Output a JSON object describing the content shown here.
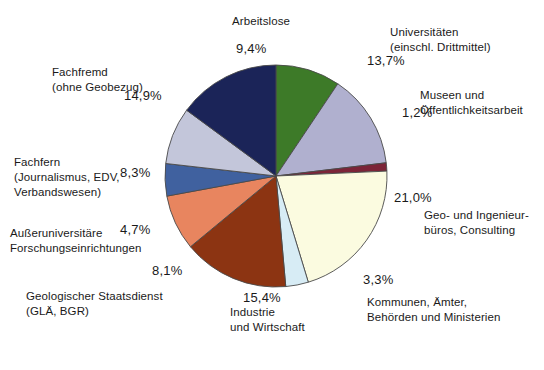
{
  "chart_data": {
    "type": "pie",
    "title": "",
    "subtitle": "",
    "xlabel": "",
    "ylabel": "",
    "legend_position": "none",
    "grid": false,
    "value_suffix": "%",
    "decimal_separator": ",",
    "start_angle_deg": -90,
    "direction": "clockwise",
    "categories": [
      "Arbeitslose",
      "Universitäten (einschl. Drittmittel)",
      "Museen und Öffentlichkeitsarbeit",
      "Geo- und Ingenieurbüros, Consulting",
      "Kommunen, Ämter, Behörden und Ministerien",
      "Industrie und Wirtschaft",
      "Geologischer Staatsdienst (GLÄ, BGR)",
      "Außeruniversitäre Forschungseinrichtungen",
      "Fachfern (Journalismus, EDV, Verbandswesen)",
      "Fachfremd (ohne Geobezug)"
    ],
    "values": [
      9.4,
      13.7,
      1.2,
      21.0,
      3.3,
      15.4,
      8.1,
      4.7,
      8.3,
      14.9
    ],
    "colors": [
      "#3d7a28",
      "#b0b0cf",
      "#7c2438",
      "#fbfbe0",
      "#d7ecf5",
      "#8c3412",
      "#e8855f",
      "#40619f",
      "#c3c6da",
      "#1b2458"
    ],
    "slice_border_color": "#4a4a4a",
    "slices": [
      {
        "label_lines": [
          "Arbeitslose"
        ],
        "percent": "9,4%",
        "value": 9.4,
        "color": "#3d7a28"
      },
      {
        "label_lines": [
          "Universitäten",
          "(einschl. Drittmittel)"
        ],
        "percent": "13,7%",
        "value": 13.7,
        "color": "#b0b0cf"
      },
      {
        "label_lines": [
          "Museen und",
          "Öffentlichkeitsarbeit"
        ],
        "percent": "1,2%",
        "value": 1.2,
        "color": "#7c2438"
      },
      {
        "label_lines": [
          "Geo- und Ingenieur-",
          "büros, Consulting"
        ],
        "percent": "21,0%",
        "value": 21.0,
        "color": "#fbfbe0"
      },
      {
        "label_lines": [
          "Kommunen, Ämter,",
          "Behörden und Ministerien"
        ],
        "percent": "3,3%",
        "value": 3.3,
        "color": "#d7ecf5"
      },
      {
        "label_lines": [
          "Industrie",
          "und Wirtschaft"
        ],
        "percent": "15,4%",
        "value": 15.4,
        "color": "#8c3412"
      },
      {
        "label_lines": [
          "Geologischer Staatsdienst",
          "(GLÄ, BGR)"
        ],
        "percent": "8,1%",
        "value": 8.1,
        "color": "#e8855f"
      },
      {
        "label_lines": [
          "Außeruniversitäre",
          "Forschungseinrichtungen"
        ],
        "percent": "4,7%",
        "value": 4.7,
        "color": "#40619f"
      },
      {
        "label_lines": [
          "Fachfern",
          "(Journalismus, EDV,",
          "Verbandswesen)"
        ],
        "percent": "8,3%",
        "value": 8.3,
        "color": "#c3c6da"
      },
      {
        "label_lines": [
          "Fachfremd",
          "(ohne Geobezug)"
        ],
        "percent": "14,9%",
        "value": 14.9,
        "color": "#1b2458"
      }
    ]
  },
  "labels": {
    "arbeitslose": "Arbeitslose",
    "universitaeten": "Universitäten\n(einschl. Drittmittel)",
    "museen": "Museen und\nÖffentlichkeitsarbeit",
    "geo": "Geo- und Ingenieur-\nbüros, Consulting",
    "kommunen": "Kommunen, Ämter,\nBehörden und Ministerien",
    "industrie": "Industrie\nund Wirtschaft",
    "geologischer": "Geologischer Staatsdienst\n(GLÄ, BGR)",
    "ausser": "Außeruniversitäre\nForschungseinrichtungen",
    "fachfern": "Fachfern\n(Journalismus, EDV,\nVerbandswesen)",
    "fachfremd": "Fachfremd\n(ohne Geobezug)"
  },
  "percentages": {
    "arbeitslose": "9,4%",
    "universitaeten": "13,7%",
    "museen": "1,2%",
    "geo": "21,0%",
    "kommunen": "3,3%",
    "industrie": "15,4%",
    "geologischer": "8,1%",
    "ausser": "4,7%",
    "fachfern": "8,3%",
    "fachfremd": "14,9%"
  }
}
